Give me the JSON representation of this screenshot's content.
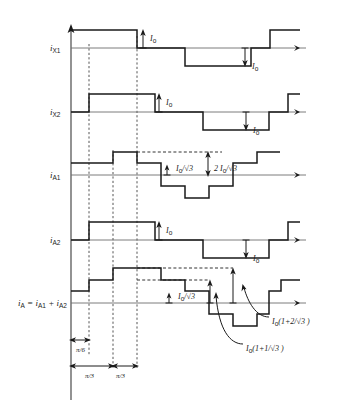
{
  "figure": {
    "type": "waveform-timing-diagram",
    "background_color": "#ffffff",
    "line_color": "#1a1a1a",
    "dashed_guide_color": "#555555"
  },
  "traces": [
    {
      "id": "ix1",
      "label": "i",
      "label_sub": "X1",
      "baseline_y": 48,
      "description": "Rectangular 120-degree conduction waveform, starts high at origin"
    },
    {
      "id": "ix2",
      "label": "i",
      "label_sub": "X2",
      "baseline_y": 112,
      "description": "Rectangular 120-degree conduction waveform phase shifted by pi/6"
    },
    {
      "id": "ia1",
      "label": "i",
      "label_sub": "A1",
      "baseline_y": 175,
      "description": "Three level stepped waveform referred to primary"
    },
    {
      "id": "ia2",
      "label": "i",
      "label_sub": "A2",
      "baseline_y": 240,
      "description": "Rectangular waveform referred to primary"
    },
    {
      "id": "ia_sum",
      "label": "i",
      "label_sub": "A",
      "label_eq": " = i",
      "label_eq_sub": "A1",
      "label_eq2": " + i",
      "label_eq2_sub": "A2",
      "baseline_y": 303,
      "description": "Twelve pulse stepped composite waveform"
    }
  ],
  "amplitude_annotations": [
    {
      "id": "ix1-pos",
      "text": "I",
      "sub": "o",
      "x": 150,
      "y": 37
    },
    {
      "id": "ix1-neg",
      "text": "I",
      "sub": "o",
      "x": 252,
      "y": 65
    },
    {
      "id": "ix2-pos",
      "text": "I",
      "sub": "o",
      "x": 166,
      "y": 101
    },
    {
      "id": "ix2-neg",
      "text": "I",
      "sub": "o",
      "x": 253,
      "y": 129
    },
    {
      "id": "ia1-small",
      "text": "I",
      "sub": "o",
      "suffix": "/√3",
      "x": 176,
      "y": 168
    },
    {
      "id": "ia1-large",
      "prefix": "2 ",
      "text": "I",
      "sub": "o",
      "suffix": "/√3",
      "x": 215,
      "y": 168
    },
    {
      "id": "ia2-pos",
      "text": "I",
      "sub": "o",
      "x": 166,
      "y": 229
    },
    {
      "id": "ia2-neg",
      "text": "I",
      "sub": "o",
      "x": 253,
      "y": 257
    },
    {
      "id": "iasum-small",
      "text": "I",
      "sub": "o",
      "suffix": "/√3",
      "x": 178,
      "y": 296
    }
  ],
  "callouts": [
    {
      "id": "callout-1-plus-2-over-root3",
      "text": "I",
      "sub": "o",
      "suffix": "(1+2/√3 )",
      "x": 272,
      "y": 321
    },
    {
      "id": "callout-1-plus-1-over-root3",
      "text": "I",
      "sub": "o",
      "suffix": "(1+1/√3 )",
      "x": 246,
      "y": 348
    }
  ],
  "dimensions": [
    {
      "id": "dim-pi-over-6",
      "text": "π/6",
      "x": 88,
      "y": 348
    },
    {
      "id": "dim-pi-over-3-first",
      "text": "π/3",
      "x": 101,
      "y": 374
    },
    {
      "id": "dim-pi-over-3-second",
      "text": "π/3",
      "x": 125,
      "y": 374
    }
  ],
  "guides": {
    "vertical_dashed_x": [
      89,
      113,
      137
    ],
    "axis_x": 71,
    "axis_top_y": 26,
    "axis_bottom_y": 400
  }
}
